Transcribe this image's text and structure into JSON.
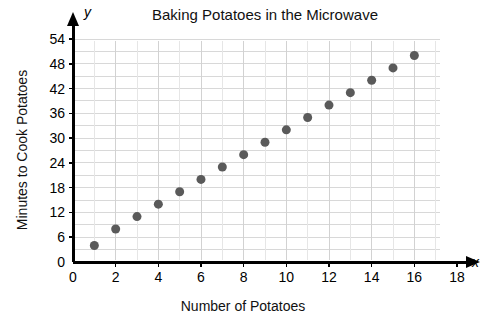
{
  "chart_data": {
    "type": "scatter",
    "title": "Baking Potatoes in the Microwave",
    "xlabel": "Number of Potatoes",
    "ylabel": "Minutes to Cook Potatoes",
    "x_axis_letter": "x",
    "y_axis_letter": "y",
    "xlim": [
      0,
      18
    ],
    "ylim": [
      0,
      54
    ],
    "x_ticks": [
      0,
      2,
      4,
      6,
      8,
      10,
      12,
      14,
      16,
      18
    ],
    "x_tick_labels": [
      "0",
      "2",
      "4",
      "6",
      "8",
      "10",
      "12",
      "14",
      "16",
      "18"
    ],
    "y_ticks": [
      0,
      6,
      12,
      18,
      24,
      30,
      36,
      42,
      48,
      54
    ],
    "y_tick_labels": [
      "0",
      "6",
      "12",
      "18",
      "24",
      "30",
      "36",
      "42",
      "48",
      "54"
    ],
    "grid": true,
    "grid_y_step": 3,
    "grid_x_step": 1,
    "legend": "none",
    "marker_color": "#5a5a5a",
    "marker_size": 9,
    "axis_color": "#000000",
    "grid_color": "#d8d8d8",
    "x": [
      1,
      2,
      3,
      4,
      5,
      6,
      7,
      8,
      9,
      10,
      11,
      12,
      13,
      14,
      15,
      16
    ],
    "y": [
      4,
      8,
      11,
      14,
      17,
      20,
      23,
      26,
      29,
      32,
      35,
      38,
      41,
      44,
      47,
      50
    ],
    "points": [
      {
        "x": 1,
        "y": 4
      },
      {
        "x": 2,
        "y": 8
      },
      {
        "x": 3,
        "y": 11
      },
      {
        "x": 4,
        "y": 14
      },
      {
        "x": 5,
        "y": 17
      },
      {
        "x": 6,
        "y": 20
      },
      {
        "x": 7,
        "y": 23
      },
      {
        "x": 8,
        "y": 26
      },
      {
        "x": 9,
        "y": 29
      },
      {
        "x": 10,
        "y": 32
      },
      {
        "x": 11,
        "y": 35
      },
      {
        "x": 12,
        "y": 38
      },
      {
        "x": 13,
        "y": 41
      },
      {
        "x": 14,
        "y": 44
      },
      {
        "x": 15,
        "y": 47
      },
      {
        "x": 16,
        "y": 50
      }
    ]
  }
}
